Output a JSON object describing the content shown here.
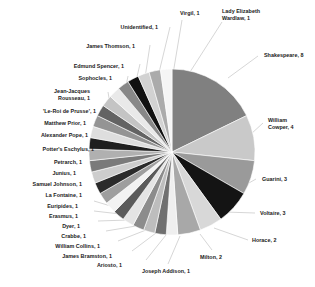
{
  "chart_data": {
    "type": "pie",
    "title": "",
    "subtitle": "",
    "xlabel": "",
    "ylabel": "",
    "legend_position": "none",
    "grid": false,
    "label_format": "name, value",
    "total": 46,
    "categories": [
      "Shakespeare",
      "William Cowper",
      "Guarini",
      "Voltaire",
      "Horace",
      "Milton",
      "Joseph Addison",
      "Ariosto",
      "James Bramston",
      "William Collins",
      "Crabbe",
      "Dyer",
      "Erasmus",
      "Euripides",
      "La Fontaine",
      "Samuel Johnson",
      "Junius",
      "Petrarch",
      "Potter's Eschylus",
      "Alexander Pope",
      "Matthew Prior",
      "'Le-Roi de Prusse'",
      "Jean-Jacques Rousseau",
      "Sophocles",
      "Edmund Spencer",
      "James Thomson",
      "Unidentified",
      "Virgil",
      "Lady Elizabeth Wardlaw"
    ],
    "values": [
      8,
      4,
      3,
      3,
      2,
      2,
      1,
      1,
      1,
      1,
      1,
      1,
      1,
      1,
      1,
      1,
      1,
      1,
      1,
      1,
      1,
      1,
      1,
      1,
      1,
      1,
      1,
      1,
      1
    ],
    "colors": [
      "#808080",
      "#c9c9c9",
      "#9a9a9a",
      "#141414",
      "#d8d8d8",
      "#a8a8a8",
      "#efefef",
      "#707070",
      "#bdbdbd",
      "#8c8c8c",
      "#e4e4e4",
      "#5a5a5a",
      "#f2f2f2",
      "#9e9e9e",
      "#2b2b2b",
      "#cdcdcd",
      "#7a7a7a",
      "#b0b0b0",
      "#1f1f1f",
      "#dedede",
      "#949494",
      "#636363",
      "#c4c4c4",
      "#e9e9e9",
      "#888888",
      "#111111",
      "#d2d2d2",
      "#ababab",
      "#f5f5f5"
    ],
    "labels": [
      {
        "text": "Shakespeare, 8"
      },
      {
        "text": "William\nCowper, 4"
      },
      {
        "text": "Guarini, 3"
      },
      {
        "text": "Voltaire, 3"
      },
      {
        "text": "Horace, 2"
      },
      {
        "text": "Milton, 2"
      },
      {
        "text": "Joseph Addison, 1"
      },
      {
        "text": "Ariosto, 1"
      },
      {
        "text": "James Bramston, 1"
      },
      {
        "text": "William Collins, 1"
      },
      {
        "text": "Crabbe, 1"
      },
      {
        "text": "Dyer, 1"
      },
      {
        "text": "Erasmus, 1"
      },
      {
        "text": "Euripides, 1"
      },
      {
        "text": "La Fontaine, 1"
      },
      {
        "text": "Samuel Johnson, 1"
      },
      {
        "text": "Junius, 1"
      },
      {
        "text": "Petrarch, 1"
      },
      {
        "text": "Potter's Eschylus, 1"
      },
      {
        "text": "Alexander Pope, 1"
      },
      {
        "text": "Matthew Prior, 1"
      },
      {
        "text": "'Le-Roi de Prusse', 1"
      },
      {
        "text": "Jean-Jacques\nRousseau, 1"
      },
      {
        "text": "Sophocles, 1"
      },
      {
        "text": "Edmund Spencer, 1"
      },
      {
        "text": "James Thomson, 1"
      },
      {
        "text": "Unidentified, 1"
      },
      {
        "text": "Virgil, 1"
      },
      {
        "text": "Lady Elizabeth\nWardlaw, 1"
      }
    ],
    "geometry": {
      "center_x": 172,
      "center_y": 152,
      "radius": 83,
      "start_angle_deg": -90,
      "direction": "clockwise"
    },
    "label_positions": [
      {
        "x": 264,
        "y": 52,
        "align": "left"
      },
      {
        "x": 268,
        "y": 117,
        "align": "left"
      },
      {
        "x": 262,
        "y": 176,
        "align": "left"
      },
      {
        "x": 260,
        "y": 210,
        "align": "left"
      },
      {
        "x": 252,
        "y": 237,
        "align": "left"
      },
      {
        "x": 200,
        "y": 254,
        "align": "left"
      },
      {
        "x": 142,
        "y": 268,
        "align": "left"
      },
      {
        "x": 122,
        "y": 262,
        "align": "right"
      },
      {
        "x": 112,
        "y": 253,
        "align": "right"
      },
      {
        "x": 100,
        "y": 243,
        "align": "right"
      },
      {
        "x": 86,
        "y": 233,
        "align": "right"
      },
      {
        "x": 80,
        "y": 223,
        "align": "right"
      },
      {
        "x": 78,
        "y": 213,
        "align": "right"
      },
      {
        "x": 78,
        "y": 203,
        "align": "right"
      },
      {
        "x": 82,
        "y": 192,
        "align": "right"
      },
      {
        "x": 82,
        "y": 181,
        "align": "right"
      },
      {
        "x": 76,
        "y": 170,
        "align": "right"
      },
      {
        "x": 82,
        "y": 159,
        "align": "right"
      },
      {
        "x": 94,
        "y": 146,
        "align": "right"
      },
      {
        "x": 88,
        "y": 132,
        "align": "right"
      },
      {
        "x": 86,
        "y": 120,
        "align": "right"
      },
      {
        "x": 96,
        "y": 108,
        "align": "right"
      },
      {
        "x": 90,
        "y": 88,
        "align": "right"
      },
      {
        "x": 112,
        "y": 75,
        "align": "right"
      },
      {
        "x": 124,
        "y": 63,
        "align": "right"
      },
      {
        "x": 135,
        "y": 43,
        "align": "right"
      },
      {
        "x": 158,
        "y": 24,
        "align": "right"
      },
      {
        "x": 180,
        "y": 10,
        "align": "left"
      },
      {
        "x": 222,
        "y": 8,
        "align": "left"
      }
    ],
    "leaders": [
      {
        "x1": 258,
        "y1": 56,
        "x2": 228,
        "y2": 78
      },
      {
        "x1": 263,
        "y1": 123,
        "x2": 251,
        "y2": 134
      },
      {
        "x1": 256,
        "y1": 179,
        "x2": 240,
        "y2": 188
      },
      {
        "x1": 255,
        "y1": 213,
        "x2": 225,
        "y2": 212
      },
      {
        "x1": 248,
        "y1": 240,
        "x2": 214,
        "y2": 228
      },
      {
        "x1": 212,
        "y1": 250,
        "x2": 200,
        "y2": 234
      },
      {
        "x1": 168,
        "y1": 264,
        "x2": 180,
        "y2": 236
      },
      {
        "x1": 146,
        "y1": 260,
        "x2": 166,
        "y2": 235
      },
      {
        "x1": 132,
        "y1": 251,
        "x2": 156,
        "y2": 233
      },
      {
        "x1": 118,
        "y1": 241,
        "x2": 146,
        "y2": 230
      },
      {
        "x1": 106,
        "y1": 231,
        "x2": 136,
        "y2": 226
      },
      {
        "x1": 98,
        "y1": 221,
        "x2": 128,
        "y2": 220
      },
      {
        "x1": 94,
        "y1": 211,
        "x2": 120,
        "y2": 214
      },
      {
        "x1": 94,
        "y1": 201,
        "x2": 114,
        "y2": 207
      },
      {
        "x1": 98,
        "y1": 190,
        "x2": 108,
        "y2": 199
      },
      {
        "x1": 102,
        "y1": 179,
        "x2": 102,
        "y2": 190
      },
      {
        "x1": 94,
        "y1": 168,
        "x2": 97,
        "y2": 179
      },
      {
        "x1": 100,
        "y1": 157,
        "x2": 95,
        "y2": 168
      },
      {
        "x1": 110,
        "y1": 144,
        "x2": 92,
        "y2": 157
      },
      {
        "x1": 104,
        "y1": 130,
        "x2": 94,
        "y2": 146
      },
      {
        "x1": 102,
        "y1": 118,
        "x2": 98,
        "y2": 136
      },
      {
        "x1": 112,
        "y1": 106,
        "x2": 104,
        "y2": 126
      },
      {
        "x1": 108,
        "y1": 92,
        "x2": 112,
        "y2": 116
      },
      {
        "x1": 128,
        "y1": 76,
        "x2": 122,
        "y2": 106
      },
      {
        "x1": 140,
        "y1": 64,
        "x2": 132,
        "y2": 98
      },
      {
        "x1": 150,
        "y1": 45,
        "x2": 143,
        "y2": 91
      },
      {
        "x1": 170,
        "y1": 27,
        "x2": 156,
        "y2": 85
      },
      {
        "x1": 182,
        "y1": 20,
        "x2": 172,
        "y2": 80
      },
      {
        "x1": 222,
        "y1": 22,
        "x2": 190,
        "y2": 72
      }
    ]
  }
}
